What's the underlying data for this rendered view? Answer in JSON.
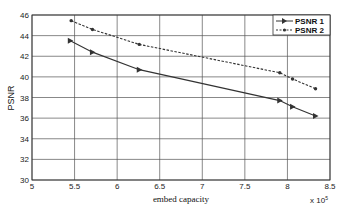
{
  "chart_data": {
    "type": "line",
    "title": "",
    "xlabel": "embed capacity",
    "ylabel": "PSNR",
    "x_multiplier": "x 10^5",
    "xlim": [
      5,
      8.5
    ],
    "ylim": [
      30,
      46
    ],
    "xticks": [
      "5",
      "5.5",
      "6",
      "6.5",
      "7",
      "7.5",
      "8",
      "8.5"
    ],
    "yticks": [
      "30",
      "32",
      "34",
      "36",
      "38",
      "40",
      "42",
      "44",
      "46"
    ],
    "grid": true,
    "legend_position": "upper right",
    "series": [
      {
        "name": "PSNR 1",
        "style": "solid",
        "marker": "triangle-right",
        "x": [
          5.45,
          5.71,
          6.26,
          7.91,
          8.06,
          8.33
        ],
        "y": [
          43.5,
          42.4,
          40.7,
          37.7,
          37.1,
          36.2
        ]
      },
      {
        "name": "PSNR 2",
        "style": "dashed",
        "marker": "circle",
        "x": [
          5.46,
          5.71,
          6.26,
          7.91,
          8.06,
          8.33
        ],
        "y": [
          45.45,
          44.6,
          43.15,
          40.4,
          39.8,
          38.85
        ]
      }
    ]
  },
  "labels": {
    "xlabel": "embed capacity",
    "ylabel": "PSNR",
    "multiplier_base": "x 10",
    "multiplier_exp": "5",
    "legend1": "PSNR 1",
    "legend2": "PSNR 2"
  }
}
